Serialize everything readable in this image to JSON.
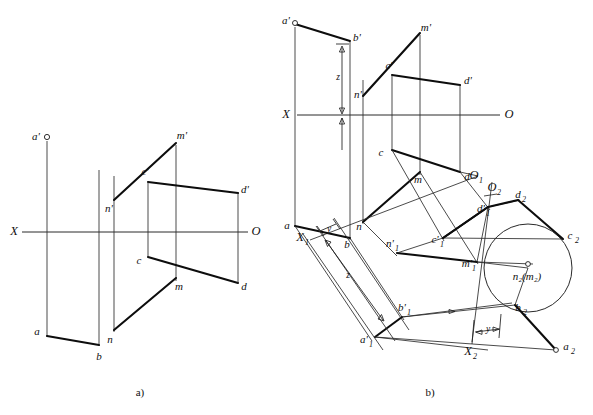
{
  "figure": {
    "captions": [
      {
        "id": "caption-a",
        "text": "a)",
        "x": 140,
        "y": 393
      },
      {
        "id": "caption-b",
        "text": "b)",
        "x": 430,
        "y": 393
      }
    ]
  },
  "diagram_a": {
    "id": "diagram-a",
    "axis": {
      "left_label": "X",
      "right_label": "O",
      "y": 232,
      "x_start": 14,
      "x_end": 252
    },
    "points": [
      {
        "name": "a-prime",
        "label": "a'",
        "x": 47,
        "y": 137,
        "lx": 36,
        "ly": 137,
        "marker": "open-dot"
      },
      {
        "name": "a",
        "label": "a",
        "x": 47,
        "y": 336,
        "lx": 37,
        "ly": 332,
        "marker": "none"
      },
      {
        "name": "b",
        "label": "b",
        "x": 99,
        "y": 345,
        "lx": 99,
        "ly": 357,
        "marker": "none"
      },
      {
        "name": "n-prime",
        "label": "n'",
        "x": 114,
        "y": 202,
        "lx": 113,
        "ly": 208,
        "marker": "none"
      },
      {
        "name": "n",
        "label": "n",
        "x": 114,
        "y": 330,
        "lx": 113,
        "ly": 337,
        "marker": "none"
      },
      {
        "name": "m-prime",
        "label": "m'",
        "x": 176,
        "y": 141,
        "lx": 180,
        "ly": 137,
        "marker": "none"
      },
      {
        "name": "m",
        "label": "m",
        "x": 176,
        "y": 278,
        "lx": 178,
        "ly": 283,
        "marker": "none"
      },
      {
        "name": "c-prime",
        "label": "c'",
        "x": 148,
        "y": 180,
        "lx": 143,
        "ly": 173,
        "marker": "none"
      },
      {
        "name": "c",
        "label": "c",
        "x": 148,
        "y": 256,
        "lx": 140,
        "ly": 259,
        "marker": "none"
      },
      {
        "name": "d-prime",
        "label": "d'",
        "x": 238,
        "y": 192,
        "lx": 243,
        "ly": 189,
        "marker": "none"
      },
      {
        "name": "d",
        "label": "d",
        "x": 238,
        "y": 283,
        "lx": 242,
        "ly": 285,
        "marker": "none"
      }
    ]
  },
  "diagram_b": {
    "id": "diagram-b",
    "axis": {
      "left_label": "X",
      "right_label": "O",
      "y": 115,
      "x_start": 291,
      "x_end": 505
    },
    "aux_axes": [
      {
        "name": "axis-x1",
        "label": "X",
        "sub": "1",
        "lx": 302,
        "ly": 238
      },
      {
        "name": "axis-x2",
        "label": "X",
        "sub": "2",
        "lx": 473,
        "ly": 348
      }
    ],
    "origins": [
      {
        "name": "origin-o1",
        "label": "O",
        "sub": "1",
        "lx": 475,
        "ly": 176
      },
      {
        "name": "origin-o2",
        "label": "O",
        "sub": "2",
        "lx": 496,
        "ly": 188
      }
    ],
    "dimensions": [
      {
        "name": "dim-z-upper",
        "label": "z"
      },
      {
        "name": "dim-y-left",
        "label": "y"
      },
      {
        "name": "dim-z-lower",
        "label": "z"
      },
      {
        "name": "dim-y-bottom",
        "label": "y"
      }
    ],
    "points": [
      {
        "name": "a-prime",
        "label": "a'",
        "x": 295,
        "y": 23,
        "lx": 286,
        "ly": 22,
        "marker": "open-dot"
      },
      {
        "name": "b-prime",
        "label": "b'",
        "x": 350,
        "y": 40,
        "lx": 354,
        "ly": 38,
        "marker": "none"
      },
      {
        "name": "a",
        "label": "a",
        "x": 295,
        "y": 226,
        "lx": 286,
        "ly": 225,
        "marker": "none"
      },
      {
        "name": "b",
        "label": "b",
        "x": 350,
        "y": 238,
        "lx": 348,
        "ly": 243,
        "marker": "none"
      },
      {
        "name": "n-prime",
        "label": "n'",
        "x": 363,
        "y": 98,
        "lx": 361,
        "ly": 97,
        "marker": "none"
      },
      {
        "name": "n",
        "label": "n",
        "x": 363,
        "y": 222,
        "lx": 358,
        "ly": 225,
        "marker": "none"
      },
      {
        "name": "m-prime",
        "label": "m'",
        "x": 420,
        "y": 31,
        "lx": 424,
        "ly": 29,
        "marker": "none"
      },
      {
        "name": "m",
        "label": "m",
        "x": 420,
        "y": 172,
        "lx": 418,
        "ly": 177,
        "marker": "none"
      },
      {
        "name": "c-prime",
        "label": "c'",
        "x": 392,
        "y": 73,
        "lx": 387,
        "ly": 67,
        "marker": "none"
      },
      {
        "name": "c",
        "label": "c",
        "x": 392,
        "y": 149,
        "lx": 380,
        "ly": 152,
        "marker": "none"
      },
      {
        "name": "d-prime",
        "label": "d'",
        "x": 460,
        "y": 84,
        "lx": 466,
        "ly": 81,
        "marker": "none"
      },
      {
        "name": "d",
        "label": "d",
        "x": 460,
        "y": 172,
        "lx": 465,
        "ly": 174,
        "marker": "none"
      },
      {
        "name": "a1-prime",
        "label": "a'",
        "sub": "1",
        "x": 375,
        "y": 337,
        "lx": 363,
        "ly": 336,
        "marker": "none"
      },
      {
        "name": "b1-prime",
        "label": "b'",
        "sub": "1",
        "x": 402,
        "y": 317,
        "lx": 404,
        "ly": 311,
        "marker": "none"
      },
      {
        "name": "n1-prime",
        "label": "n'",
        "sub": "1",
        "x": 397,
        "y": 253,
        "lx": 392,
        "ly": 245,
        "marker": "none"
      },
      {
        "name": "m1-prime",
        "label": "m'",
        "sub": "1",
        "x": 477,
        "y": 262,
        "lx": 470,
        "ly": 263,
        "marker": "none"
      },
      {
        "name": "c1-prime",
        "label": "c'",
        "sub": "1",
        "x": 443,
        "y": 238,
        "lx": 438,
        "ly": 239,
        "marker": "none"
      },
      {
        "name": "d1-prime",
        "label": "d'",
        "sub": "1",
        "x": 488,
        "y": 207,
        "lx": 482,
        "ly": 207,
        "marker": "none"
      },
      {
        "name": "d2",
        "label": "d",
        "sub": "2",
        "x": 518,
        "y": 200,
        "lx": 520,
        "ly": 196,
        "marker": "none"
      },
      {
        "name": "c2",
        "label": "c",
        "sub": "2",
        "x": 563,
        "y": 239,
        "lx": 570,
        "ly": 238,
        "marker": "none"
      },
      {
        "name": "b2",
        "label": "b",
        "sub": "2",
        "x": 515,
        "y": 305,
        "lx": 519,
        "ly": 307,
        "marker": "none"
      },
      {
        "name": "a2",
        "label": "a",
        "sub": "2",
        "x": 556,
        "y": 350,
        "lx": 563,
        "ly": 348,
        "marker": "open-dot"
      },
      {
        "name": "n2-m2",
        "label": "n₂(m₂)",
        "x": 528,
        "y": 268,
        "lx": 508,
        "ly": 278,
        "marker": "open-dot"
      }
    ]
  },
  "colors": {
    "stroke_thick": "#0d0d0d",
    "stroke_thin": "#2a2a2a",
    "background": "#ffffff",
    "text": "#101010"
  }
}
